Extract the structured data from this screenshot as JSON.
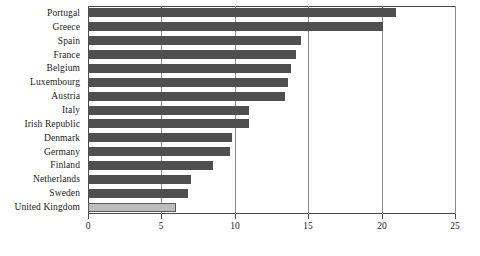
{
  "chart_data": {
    "type": "bar",
    "orientation": "horizontal",
    "title": "",
    "subtitle": "",
    "xlabel": "",
    "ylabel": "",
    "xlim": [
      0,
      25
    ],
    "xticks": [
      0,
      5,
      10,
      15,
      20,
      25
    ],
    "xtick_labels": [
      "0",
      "5",
      "10",
      "15",
      "20",
      "25"
    ],
    "grid": true,
    "grid_axis": "x",
    "legend": false,
    "legend_position": "none",
    "categories": [
      "Portugal",
      "Greece",
      "Spain",
      "France",
      "Belgium",
      "Luxembourg",
      "Austria",
      "Italy",
      "Irish Republic",
      "Denmark",
      "Germany",
      "Finland",
      "Netherlands",
      "Sweden",
      "United Kingdom"
    ],
    "values": [
      21.0,
      20.1,
      14.5,
      14.2,
      13.8,
      13.6,
      13.4,
      11.0,
      11.0,
      9.8,
      9.7,
      8.5,
      7.0,
      6.8,
      6.0
    ],
    "highlight_category": "United Kingdom",
    "bars": [
      {
        "category": "Portugal",
        "value": 21.0,
        "highlighted": false
      },
      {
        "category": "Greece",
        "value": 20.1,
        "highlighted": false
      },
      {
        "category": "Spain",
        "value": 14.5,
        "highlighted": false
      },
      {
        "category": "France",
        "value": 14.2,
        "highlighted": false
      },
      {
        "category": "Belgium",
        "value": 13.8,
        "highlighted": false
      },
      {
        "category": "Luxembourg",
        "value": 13.6,
        "highlighted": false
      },
      {
        "category": "Austria",
        "value": 13.4,
        "highlighted": false
      },
      {
        "category": "Italy",
        "value": 11.0,
        "highlighted": false
      },
      {
        "category": "Irish Republic",
        "value": 11.0,
        "highlighted": false
      },
      {
        "category": "Denmark",
        "value": 9.8,
        "highlighted": false
      },
      {
        "category": "Germany",
        "value": 9.7,
        "highlighted": false
      },
      {
        "category": "Finland",
        "value": 8.5,
        "highlighted": false
      },
      {
        "category": "Netherlands",
        "value": 7.0,
        "highlighted": false
      },
      {
        "category": "Sweden",
        "value": 6.8,
        "highlighted": false
      },
      {
        "category": "United Kingdom",
        "value": 6.0,
        "highlighted": true
      }
    ]
  },
  "colors": {
    "bar": "#4f4f4f",
    "bar_highlight": "#bcbcbc",
    "bar_highlight_border": "#5a5a5a",
    "gridline": "#8a8a8a",
    "axis": "#4a4a4a",
    "text": "#1a1a1a",
    "background": "#ffffff"
  }
}
